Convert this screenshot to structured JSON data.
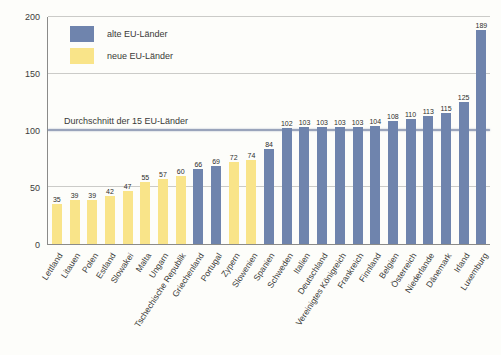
{
  "chart_data": {
    "type": "bar",
    "title": "",
    "xlabel": "",
    "ylabel": "",
    "ylim": [
      0,
      200
    ],
    "yticks": [
      0,
      50,
      100,
      150,
      200
    ],
    "grid": "horizontal",
    "legend_position": "top-left-inside",
    "average_line": {
      "value": 100,
      "label": "Durchschnitt der 15 EU-Länder"
    },
    "legend": [
      {
        "label": "alte EU-Länder",
        "group": "alte"
      },
      {
        "label": "neue EU-Länder",
        "group": "neue"
      }
    ],
    "countries": [
      {
        "name": "Lettland",
        "value": 35,
        "group": "neue"
      },
      {
        "name": "Litauen",
        "value": 39,
        "group": "neue"
      },
      {
        "name": "Polen",
        "value": 39,
        "group": "neue"
      },
      {
        "name": "Estland",
        "value": 42,
        "group": "neue"
      },
      {
        "name": "Slowakei",
        "value": 47,
        "group": "neue"
      },
      {
        "name": "Malta",
        "value": 55,
        "group": "neue"
      },
      {
        "name": "Ungarn",
        "value": 57,
        "group": "neue"
      },
      {
        "name": "Tschechische Republik",
        "value": 60,
        "group": "neue"
      },
      {
        "name": "Griechenland",
        "value": 66,
        "group": "alte"
      },
      {
        "name": "Portugal",
        "value": 69,
        "group": "alte"
      },
      {
        "name": "Zypern",
        "value": 72,
        "group": "neue"
      },
      {
        "name": "Slowenien",
        "value": 74,
        "group": "neue"
      },
      {
        "name": "Spanien",
        "value": 84,
        "group": "alte"
      },
      {
        "name": "Schweden",
        "value": 102,
        "group": "alte"
      },
      {
        "name": "Italien",
        "value": 103,
        "group": "alte"
      },
      {
        "name": "Deutschland",
        "value": 103,
        "group": "alte"
      },
      {
        "name": "Vereinigtes Königreich",
        "value": 103,
        "group": "alte"
      },
      {
        "name": "Frankreich",
        "value": 103,
        "group": "alte"
      },
      {
        "name": "Finnland",
        "value": 104,
        "group": "alte"
      },
      {
        "name": "Belgien",
        "value": 108,
        "group": "alte"
      },
      {
        "name": "Österreich",
        "value": 110,
        "group": "alte"
      },
      {
        "name": "Niederlande",
        "value": 113,
        "group": "alte"
      },
      {
        "name": "Dänemark",
        "value": 115,
        "group": "alte"
      },
      {
        "name": "Irland",
        "value": 125,
        "group": "alte"
      },
      {
        "name": "Luxemburg",
        "value": 189,
        "group": "alte"
      }
    ]
  },
  "colors": {
    "alte": "#6f84ad",
    "neue": "#f9e489",
    "grid": "#cbcbc8",
    "axis": "#8b8b89",
    "average_line": "#9aa4bb",
    "text": "#3a3a38",
    "background": "#fdfdfa"
  }
}
